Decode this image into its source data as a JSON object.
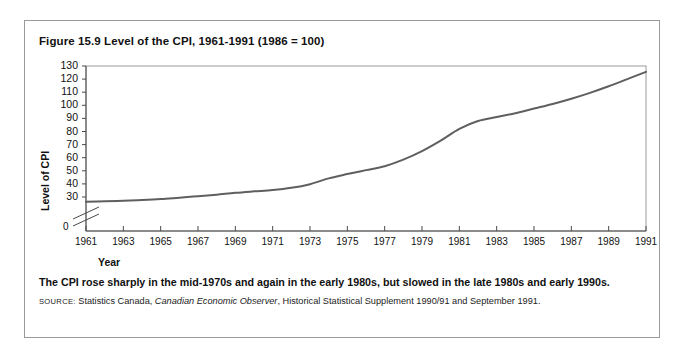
{
  "figure": {
    "title": "Figure 15.9 Level of the CPI, 1961-1991 (1986 = 100)",
    "caption": "The CPI rose sharply in the mid-1970s and again in the early 1980s, but slowed in the late 1980s and early 1990s.",
    "source_label": "SOURCE:",
    "source_text_1": " Statistics Canada, ",
    "source_italic": "Canadian Economic Observer",
    "source_text_2": ", Historical Statistical Supplement 1990/91 and September 1991."
  },
  "axes": {
    "y_title": "Level of CPI",
    "x_title": "Year",
    "origin_label": "0",
    "y_ticks": [
      130,
      120,
      110,
      100,
      90,
      80,
      70,
      60,
      50,
      40,
      30
    ],
    "x_ticks": [
      1961,
      1963,
      1965,
      1967,
      1969,
      1971,
      1973,
      1975,
      1977,
      1979,
      1981,
      1983,
      1985,
      1987,
      1989,
      1991
    ],
    "axis_break": true
  },
  "colors": {
    "line": "#5f5f5f",
    "axis": "#4a4a4a",
    "frame": "#9a9a9a",
    "text": "#111111"
  },
  "chart_data": {
    "type": "line",
    "title": "Figure 15.9 Level of the CPI, 1961-1991 (1986 = 100)",
    "xlabel": "Year",
    "ylabel": "Level of CPI",
    "xlim": [
      1961,
      1991
    ],
    "ylim": [
      26,
      130
    ],
    "grid": false,
    "legend": null,
    "y_axis_break_below": 30,
    "series": [
      {
        "name": "Level of CPI (1986 = 100)",
        "x": [
          1961,
          1962,
          1963,
          1964,
          1965,
          1966,
          1967,
          1968,
          1969,
          1970,
          1971,
          1972,
          1973,
          1974,
          1975,
          1976,
          1977,
          1978,
          1979,
          1980,
          1981,
          1982,
          1983,
          1984,
          1985,
          1986,
          1987,
          1988,
          1989,
          1990,
          1991
        ],
        "values": [
          26.4,
          26.7,
          27.2,
          27.7,
          28.4,
          29.5,
          30.6,
          31.8,
          33.2,
          34.3,
          35.3,
          37.0,
          39.8,
          44.2,
          49.0,
          52.8,
          57.0,
          62.2,
          68.0,
          74.9,
          84.2,
          93.3,
          98.7,
          103.0,
          107.0,
          110.0,
          114.8,
          119.5,
          125.2,
          131.3,
          138.6
        ],
        "values_as_plotted": [
          26.4,
          26.7,
          27.2,
          27.7,
          28.4,
          29.5,
          30.6,
          31.8,
          33.2,
          34.3,
          35.3,
          37.0,
          39.8,
          44.2,
          47.5,
          50.5,
          53.5,
          58.5,
          65.0,
          73.0,
          82.0,
          88.0,
          91.0,
          94.0,
          97.5,
          101.0,
          105.0,
          109.5,
          114.5,
          120.0,
          125.5
        ]
      }
    ]
  }
}
